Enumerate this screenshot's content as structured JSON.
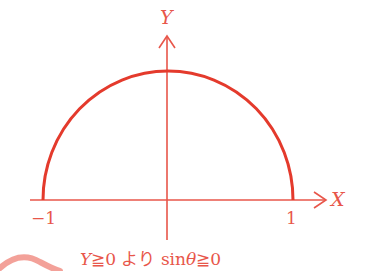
{
  "diagram": {
    "type": "semicircle-on-axes",
    "colors": {
      "curve": "#e43a2c",
      "axis": "#e8564a",
      "text": "#e8564a",
      "decoration": "#f08a80"
    },
    "axes": {
      "x_label": "X",
      "y_label": "Y"
    },
    "ticks": {
      "negative": "−1",
      "positive": "1"
    },
    "curve": {
      "description": "upper semicircle of unit circle",
      "x_range": [
        -1,
        1
      ],
      "y_min": 0
    },
    "caption": {
      "var_y": "Y",
      "geq1": "≧",
      "zero1": "0",
      "yori": "より",
      "sin": "sin",
      "theta": "θ",
      "geq2": "≧",
      "zero2": "0",
      "full": "Y≧0 より sinθ≧0"
    }
  }
}
